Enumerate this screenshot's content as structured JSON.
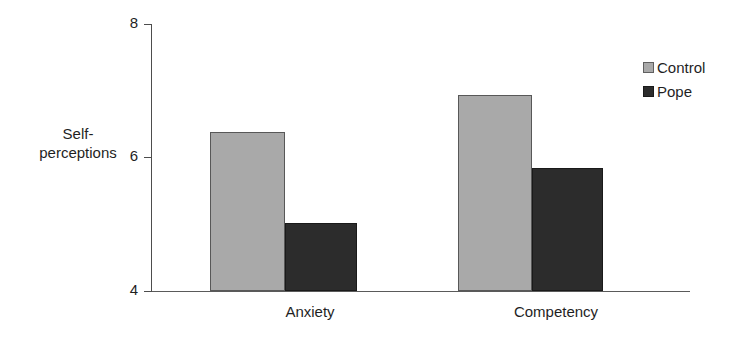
{
  "chart_data": {
    "type": "bar",
    "title": "",
    "categories": [
      "Anxiety",
      "Competency"
    ],
    "series": [
      {
        "name": "Control",
        "values": [
          6.38,
          6.93
        ],
        "color": "#a9a9a9"
      },
      {
        "name": "Pope",
        "values": [
          5.02,
          5.84
        ],
        "color": "#2c2c2c"
      }
    ],
    "xlabel": "",
    "ylabel": "Self-perceptions",
    "ylabel_lines": [
      "Self-",
      "perceptions"
    ],
    "ylim": [
      4,
      8
    ],
    "yticks": [
      4,
      6,
      8
    ],
    "ytick_labels": [
      "4",
      "6",
      "8"
    ],
    "grid": false,
    "legend_position": "top-right"
  },
  "axis": {
    "y_title_line1": "Self-",
    "y_title_line2": "perceptions",
    "tick_top": "8",
    "tick_mid": "6",
    "tick_bottom": "4"
  },
  "categories": {
    "first": "Anxiety",
    "second": "Competency"
  },
  "legend": {
    "items": [
      {
        "label": "Control",
        "swatch": "light-gray-square"
      },
      {
        "label": "Pope",
        "swatch": "dark-gray-square"
      }
    ]
  }
}
